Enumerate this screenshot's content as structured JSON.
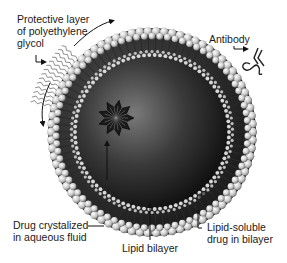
{
  "figure": {
    "labels": {
      "peg_line1": "Protective layer",
      "peg_line2": "of polyethylene",
      "peg_line3": "glycol",
      "antibody": "Antibody",
      "drug_cryst_line1": "Drug crystalized",
      "drug_cryst_line2": "in aqueous fluid",
      "lipid_bilayer": "Lipid bilayer",
      "lipid_drug_line1": "Lipid-soluble",
      "lipid_drug_line2": "drug in bilayer"
    },
    "colors": {
      "background": "#ffffff",
      "core_dark": "#0d0d0d",
      "core_light": "#6e6e6e",
      "lipid_head": "#d9d9d9",
      "text": "#1a1a1a"
    }
  }
}
